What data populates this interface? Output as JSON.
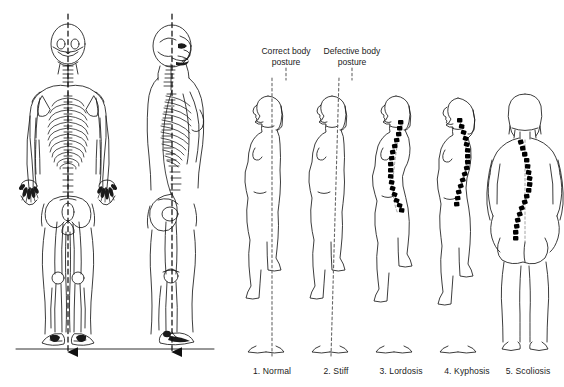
{
  "diagram": {
    "background_color": "#ffffff",
    "ink_color": "#1a1a1a",
    "plumb_line_color": "#555555",
    "spine_marker_color": "#000000"
  },
  "headers": [
    {
      "id": "correct",
      "text": "Correct body\nposture",
      "x": 286,
      "y": 46
    },
    {
      "id": "defective",
      "text": "Defective body\nposture",
      "x": 352,
      "y": 46
    }
  ],
  "skeletons": [
    {
      "id": "anterior-skeleton",
      "name": "full-skeleton-front-view",
      "view": "posterior",
      "cx": 68,
      "plumb_line": true,
      "ground_line": true,
      "arrow": "down"
    },
    {
      "id": "lateral-skeleton",
      "name": "full-skeleton-side-view",
      "view": "lateral-right-facing",
      "cx": 174,
      "plumb_line": true,
      "ground_line": true,
      "arrow": "down"
    }
  ],
  "postures": [
    {
      "index": 1,
      "label": "1. Normal",
      "name": "posture-normal",
      "view": "lateral",
      "cx": 272,
      "plumb_line": "vertical",
      "spine_marked": false,
      "category": "correct"
    },
    {
      "index": 2,
      "label": "2. Stiff",
      "name": "posture-stiff",
      "view": "lateral",
      "cx": 336,
      "plumb_line": "tilted",
      "spine_marked": false,
      "category": "defective"
    },
    {
      "index": 3,
      "label": "3. Lordosis",
      "name": "posture-lordosis",
      "view": "lateral",
      "cx": 400,
      "plumb_line": "none",
      "spine_marked": true,
      "curve": "exaggerated-lumbar-inward",
      "category": "defective"
    },
    {
      "index": 4,
      "label": "4. Kyphosis",
      "name": "posture-kyphosis",
      "view": "lateral",
      "cx": 464,
      "plumb_line": "none",
      "spine_marked": true,
      "curve": "rounded-thoracic-outward",
      "category": "defective"
    },
    {
      "index": 5,
      "label": "5. Scoliosis",
      "name": "posture-scoliosis",
      "view": "posterior",
      "cx": 525,
      "plumb_line": "none",
      "spine_marked": true,
      "curve": "lateral-s-curve",
      "category": "defective"
    }
  ],
  "label_row_y": 372
}
